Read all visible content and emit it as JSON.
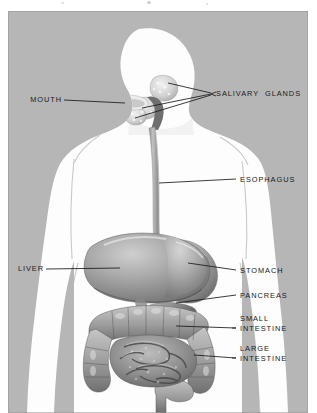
{
  "figure": {
    "kind": "anatomical-illustration",
    "background_color": "#b6b6b6",
    "body_color": "#fdfdfd",
    "leader_line_color": "#1a1a1a"
  },
  "labels": {
    "mouth": "MOUTH",
    "salivary_glands": "SALIVARY  GLANDS",
    "esophagus": "ESOPHAGUS",
    "liver": "LIVER",
    "stomach": "STOMACH",
    "pancreas": "PANCREAS",
    "small_intestine_line1": "SMALL",
    "small_intestine_line2": "INTESTINE",
    "large_intestine_line1": "LARGE",
    "large_intestine_line2": "INTESTINE"
  },
  "organs": [
    {
      "name": "salivary-glands",
      "side": "right"
    },
    {
      "name": "mouth",
      "side": "left"
    },
    {
      "name": "esophagus",
      "side": "right"
    },
    {
      "name": "liver",
      "side": "left"
    },
    {
      "name": "stomach",
      "side": "right"
    },
    {
      "name": "pancreas",
      "side": "right"
    },
    {
      "name": "small-intestine",
      "side": "right"
    },
    {
      "name": "large-intestine",
      "side": "right"
    }
  ]
}
